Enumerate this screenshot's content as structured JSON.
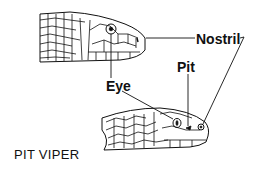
{
  "diagram": {
    "caption": "PIT VIPER",
    "labels": {
      "nostril": "Nostril",
      "pit": "Pit",
      "eye": "Eye"
    },
    "figures": [
      {
        "name": "non-venomous-snake-head",
        "features": [
          "Eye",
          "Nostril"
        ]
      },
      {
        "name": "pit-viper-head",
        "features": [
          "Eye",
          "Pit",
          "Nostril"
        ]
      }
    ],
    "colors": {
      "ink": "#111111",
      "background": "#ffffff"
    }
  }
}
